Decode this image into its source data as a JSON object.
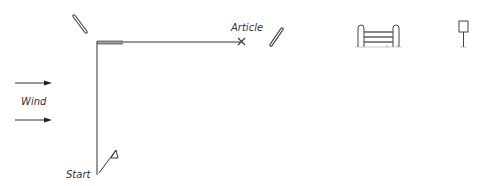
{
  "diagram": {
    "labels": {
      "article": "Article",
      "wind": "Wind",
      "start": "Start"
    },
    "icons": [
      "pole-icon-left",
      "pole-icon-right",
      "gate-fence-icon",
      "sign-post-icon",
      "start-flag-icon",
      "article-cross-icon",
      "wind-arrow-icon"
    ],
    "colors": {
      "line": "#333333",
      "bar": "#888888",
      "background": "#ffffff"
    }
  }
}
